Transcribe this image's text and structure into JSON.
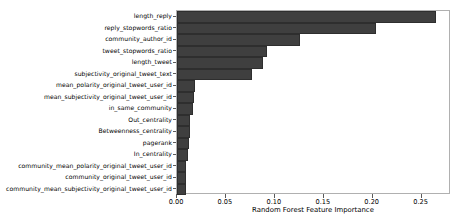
{
  "chart_data": {
    "type": "bar",
    "orientation": "horizontal",
    "title": "",
    "xlabel": "Random Forest Feature Importance",
    "ylabel": "",
    "xlim": [
      0.0,
      0.28
    ],
    "xticks": [
      "0.00",
      "0.05",
      "0.10",
      "0.15",
      "0.20",
      "0.25"
    ],
    "xtick_values": [
      0.0,
      0.05,
      0.1,
      0.15,
      0.2,
      0.25
    ],
    "grid": false,
    "legend": null,
    "bar_color": "#3f3f3f",
    "categories": [
      "length_reply",
      "reply_stopwords_ratio",
      "community_author_id",
      "tweet_stopwords_ratio",
      "length_tweet",
      "subjectivity_original_tweet_text",
      "mean_polarity_original_tweet_user_id",
      "mean_subjectivity_original_tweet_user_id",
      "in_same_community",
      "Out_centrality",
      "Betweenness_centrality",
      "pagerank",
      "In_centrality",
      "community_mean_polarity_original_tweet_user_id",
      "community_original_tweet_user_id",
      "community_mean_subjectivity_original_tweet_user_id"
    ],
    "values": [
      0.265,
      0.203,
      0.126,
      0.092,
      0.088,
      0.077,
      0.018,
      0.017,
      0.016,
      0.0135,
      0.013,
      0.0125,
      0.0115,
      0.0095,
      0.0092,
      0.009
    ]
  }
}
